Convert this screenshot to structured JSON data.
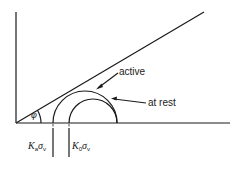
{
  "diagram": {
    "labels": {
      "active": "active",
      "at_rest": "at rest",
      "phi": "φ",
      "ka_symbol": "K",
      "ka_sub": "a",
      "ka_sigma": "σ",
      "ka_sigma_sub": "v",
      "k0_symbol": "K",
      "k0_sub": "0",
      "k0_sigma": "σ",
      "k0_sigma_sub": "v"
    },
    "colors": {
      "line": "#1a1a1a",
      "background": "#ffffff"
    }
  }
}
